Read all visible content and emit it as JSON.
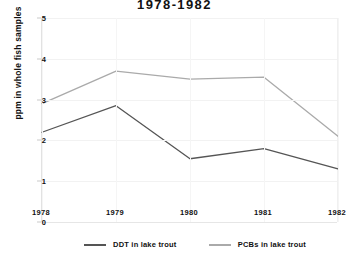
{
  "chart_data": {
    "type": "line",
    "title": "1978-1982",
    "xlabel": "",
    "ylabel": "ppm in whole fish samples",
    "x": [
      "1978",
      "1979",
      "1980",
      "1981",
      "1982"
    ],
    "categories": [
      "1978",
      "1979",
      "1980",
      "1981",
      "1982"
    ],
    "ylim": [
      0,
      5
    ],
    "yticks": [
      "0",
      "1",
      "2",
      "3",
      "4",
      "5"
    ],
    "grid": true,
    "legend_position": "bottom",
    "series": [
      {
        "name": "DDT in lake trout",
        "color": "#555555",
        "values": [
          2.2,
          2.85,
          1.55,
          1.8,
          1.3
        ]
      },
      {
        "name": "PCBs in lake trout",
        "color": "#aaaaaa",
        "values": [
          2.9,
          3.7,
          3.5,
          3.55,
          2.1
        ]
      }
    ]
  }
}
